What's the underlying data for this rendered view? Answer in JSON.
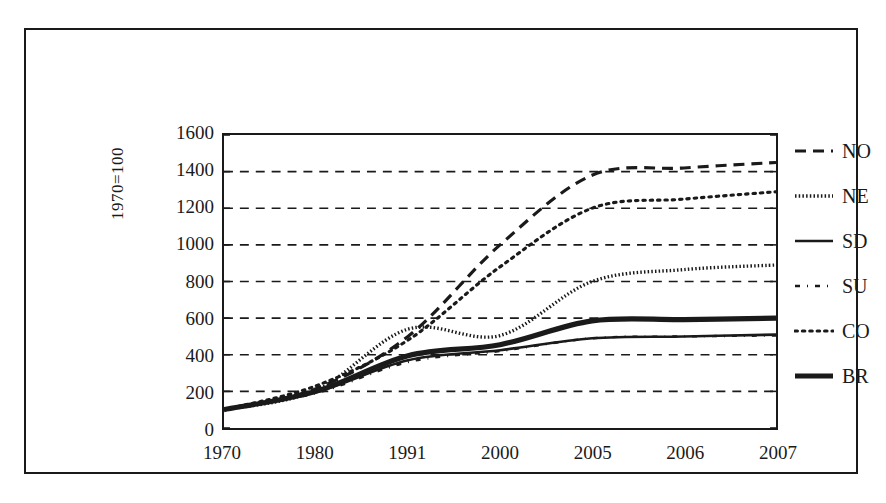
{
  "chart_data": {
    "type": "line",
    "title": "",
    "subtitle": "",
    "xlabel": "",
    "ylabel": "1970=100",
    "categories": [
      "1970",
      "1980",
      "1991",
      "2000",
      "2005",
      "2006",
      "2007"
    ],
    "ylim": [
      0,
      1600
    ],
    "ytick_values": [
      0,
      200,
      400,
      600,
      800,
      1000,
      1200,
      1400,
      1600
    ],
    "ytick_labels": [
      "0",
      "200",
      "400",
      "600",
      "800",
      "1000",
      "1200",
      "1400",
      "1600"
    ],
    "grid": "horizontal-dashed",
    "legend_position": "right",
    "series": [
      {
        "name": "NO",
        "style": "dashed",
        "values": [
          100,
          215,
          500,
          1000,
          1380,
          1420,
          1450
        ]
      },
      {
        "name": "NE",
        "style": "dense-dotted",
        "values": [
          100,
          205,
          540,
          505,
          800,
          865,
          890
        ]
      },
      {
        "name": "SD",
        "style": "solid-thin",
        "values": [
          100,
          195,
          370,
          425,
          490,
          500,
          510
        ]
      },
      {
        "name": "SU",
        "style": "dash-dot-sparse",
        "values": [
          100,
          190,
          360,
          420,
          490,
          500,
          505
        ]
      },
      {
        "name": "CO",
        "style": "fine-dotted",
        "values": [
          100,
          230,
          480,
          880,
          1200,
          1250,
          1290
        ]
      },
      {
        "name": "BR",
        "style": "solid-thick",
        "values": [
          100,
          200,
          395,
          455,
          585,
          592,
          600
        ]
      }
    ]
  },
  "legend": {
    "items": [
      {
        "label": "NO"
      },
      {
        "label": "NE"
      },
      {
        "label": "SD"
      },
      {
        "label": "SU"
      },
      {
        "label": "CO"
      },
      {
        "label": "BR"
      }
    ]
  }
}
